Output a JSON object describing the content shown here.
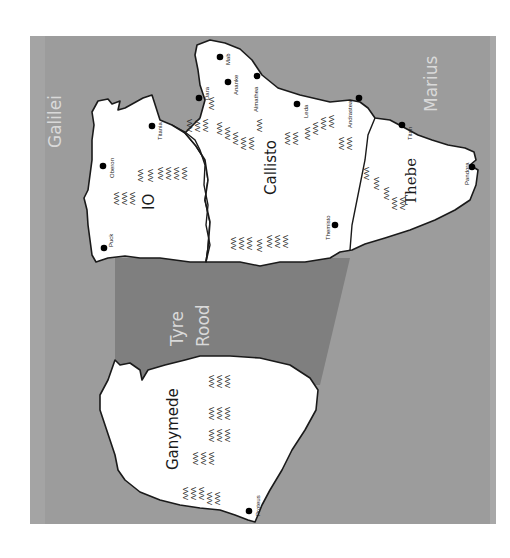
{
  "map": {
    "orientation": "rotated -90deg (text reads bottom-to-top)",
    "colors": {
      "page_background": "#ffffff",
      "sea": "#9c9c9c",
      "sea_light_band": "#a4a4a4",
      "road_area": "#7f7f7f",
      "land": "#ffffff",
      "outline": "#1a1a1a",
      "sea_label": "#d9d9d9",
      "town_marker": "#000000"
    },
    "sea_labels": {
      "galilei": "Galilei",
      "marius": "Marius",
      "tyre": "Tyre",
      "road": "Rood"
    },
    "regions": {
      "io": "IO",
      "callisto": "Callisto",
      "thebe": "Thebe",
      "ganymede": "Ganymede"
    },
    "towns": {
      "puck": "Puck",
      "oberon": "Oberon",
      "titania": "Titania",
      "dara": "Dara",
      "mab": "Mab",
      "ananke": "Ananke",
      "almathea": "Almathea",
      "leda": "Leda",
      "andrastea": "Andrastea",
      "themisto": "Themisto",
      "titan": "Titan",
      "pandora": "Pandora",
      "proteus": "Proteus"
    },
    "mountain_glyph": "ΛΛΛ"
  }
}
